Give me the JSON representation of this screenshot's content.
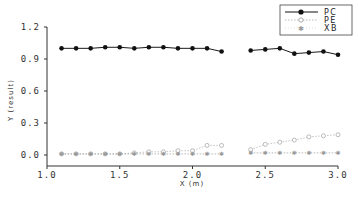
{
  "chart_data": {
    "type": "line",
    "title": "",
    "xlabel": "X (m)",
    "ylabel": "Y (result)",
    "xlim": [
      1.0,
      3.0
    ],
    "ylim": [
      -0.1,
      1.2
    ],
    "x_ticks": [
      "1.0",
      "1.5",
      "2.0",
      "2.5",
      "3.0"
    ],
    "y_ticks": [
      "0.0",
      "0.3",
      "0.6",
      "0.9",
      "1.2"
    ],
    "grid": false,
    "legend_position": "upper right",
    "series": [
      {
        "name": "PC",
        "marker": "filled-circle",
        "line": "solid",
        "color": "#000000",
        "x": [
          1.1,
          1.2,
          1.3,
          1.4,
          1.5,
          1.6,
          1.7,
          1.8,
          1.9,
          2.0,
          2.1,
          2.2,
          2.4,
          2.5,
          2.6,
          2.7,
          2.8,
          2.9,
          3.0
        ],
        "values": [
          1.0,
          1.0,
          1.0,
          1.01,
          1.01,
          1.0,
          1.01,
          1.01,
          1.0,
          1.0,
          1.0,
          0.97,
          0.98,
          0.99,
          1.0,
          0.95,
          0.96,
          0.97,
          0.94
        ]
      },
      {
        "name": "PE",
        "marker": "open-circle",
        "line": "dotted",
        "color": "#aaaaaa",
        "x": [
          1.1,
          1.2,
          1.3,
          1.4,
          1.5,
          1.6,
          1.7,
          1.8,
          1.9,
          2.0,
          2.1,
          2.2,
          2.4,
          2.5,
          2.6,
          2.7,
          2.8,
          2.9,
          3.0
        ],
        "values": [
          0.01,
          0.01,
          0.01,
          0.01,
          0.01,
          0.02,
          0.03,
          0.03,
          0.04,
          0.04,
          0.09,
          0.09,
          0.05,
          0.1,
          0.12,
          0.14,
          0.17,
          0.18,
          0.19
        ]
      },
      {
        "name": "XB",
        "marker": "star",
        "line": "dotted",
        "color": "#999999",
        "x": [
          1.1,
          1.2,
          1.3,
          1.4,
          1.5,
          1.6,
          1.7,
          1.8,
          1.9,
          2.0,
          2.1,
          2.2,
          2.4,
          2.5,
          2.6,
          2.7,
          2.8,
          2.9,
          3.0
        ],
        "values": [
          0.01,
          0.01,
          0.01,
          0.01,
          0.01,
          0.01,
          0.01,
          0.01,
          0.01,
          0.01,
          0.01,
          0.01,
          0.02,
          0.02,
          0.02,
          0.02,
          0.02,
          0.02,
          0.02
        ]
      }
    ]
  },
  "axes": {
    "xlabel": "X  (m)",
    "ylabel": "Y (result)"
  },
  "legend": {
    "items": [
      {
        "label": "PC"
      },
      {
        "label": "PE"
      },
      {
        "label": "XB"
      }
    ]
  }
}
